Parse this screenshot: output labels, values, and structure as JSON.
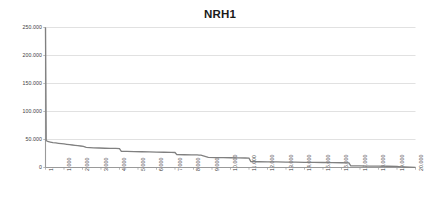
{
  "chart_data": {
    "type": "line",
    "title": "NRH1",
    "xlabel": "",
    "ylabel": "",
    "grid": true,
    "legend": false,
    "legend_position": "none",
    "line_color": "#808080",
    "gridline_color": "#d9d9d9",
    "axis_color": "#9a9a9a",
    "background_color": "#ffffff",
    "text_color": "#3d3d3d",
    "xlim": [
      1,
      20000
    ],
    "ylim": [
      0,
      250000
    ],
    "ytick_labels": [
      "0",
      "50.000",
      "100.000",
      "150.000",
      "200.000",
      "250.000"
    ],
    "ytick_values": [
      0,
      50000,
      100000,
      150000,
      200000,
      250000
    ],
    "xtick_labels": [
      "1",
      "1.000",
      "2.000",
      "3.000",
      "4.000",
      "5.000",
      "6.000",
      "7.000",
      "8.000",
      "9.000",
      "10.000",
      "11.000",
      "12.000",
      "13.000",
      "14.000",
      "15.000",
      "16.000",
      "17.000",
      "18.000",
      "19.000",
      "20.000"
    ],
    "xtick_values": [
      1,
      1000,
      2000,
      3000,
      4000,
      5000,
      6000,
      7000,
      8000,
      9000,
      10000,
      11000,
      12000,
      13000,
      14000,
      15000,
      16000,
      17000,
      18000,
      19000,
      20000
    ],
    "series": [
      {
        "name": "NRH1",
        "x": [
          1,
          40,
          120,
          260,
          400,
          560,
          700,
          860,
          1000,
          1150,
          1300,
          1450,
          1600,
          1750,
          1900,
          2050,
          2200,
          2400,
          2600,
          2900,
          3200,
          3500,
          3800,
          4000,
          4100,
          4400,
          4800,
          5200,
          5600,
          6000,
          6400,
          6800,
          7000,
          7100,
          7500,
          7900,
          8200,
          8300,
          8400,
          8800,
          9200,
          9600,
          10000,
          10400,
          10800,
          11000,
          11100,
          11500,
          12000,
          12500,
          13000,
          13500,
          14000,
          14500,
          15000,
          15500,
          16000,
          16400,
          16500,
          17000,
          17500,
          18000,
          18500,
          19000,
          19200,
          19400,
          19700,
          20000
        ],
        "y": [
          250000,
          48000,
          46500,
          45500,
          44500,
          43800,
          43200,
          42600,
          42000,
          41400,
          40800,
          40200,
          39600,
          39000,
          38400,
          37800,
          36000,
          35600,
          35200,
          34800,
          34400,
          34200,
          34000,
          33800,
          29000,
          28700,
          28400,
          28100,
          27800,
          27500,
          27200,
          27000,
          26800,
          23000,
          22800,
          22600,
          22400,
          22200,
          22000,
          18000,
          17800,
          17600,
          17400,
          17200,
          17000,
          16800,
          10500,
          10300,
          10100,
          9900,
          9700,
          9500,
          9300,
          9100,
          8900,
          8700,
          8500,
          8300,
          3000,
          2800,
          2600,
          2400,
          2200,
          2000,
          1200,
          900,
          600,
          400
        ]
      }
    ]
  }
}
